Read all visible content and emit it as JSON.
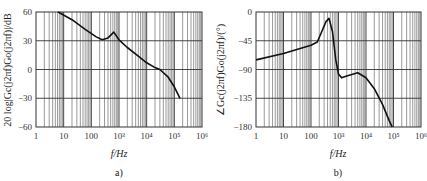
{
  "chart_data": [
    {
      "id": "a",
      "type": "line",
      "caption": "a)",
      "title": "",
      "xlabel": "f/Hz",
      "ylabel": "20 log|Gc(j2πf)Go(j2πf)|/dB",
      "xscale": "log",
      "xlim": [
        1,
        1000000
      ],
      "ylim": [
        -60,
        60
      ],
      "x_tick_labels": [
        "1",
        "10",
        "100",
        "10³",
        "10⁴",
        "10⁵",
        "10⁶"
      ],
      "y_ticks": [
        60,
        30,
        0,
        -30,
        -60
      ],
      "grid": true,
      "legend": null,
      "series": [
        {
          "name": "magnitude",
          "x": [
            6.3,
            20,
            60,
            150,
            250,
            400,
            650,
            1000,
            2000,
            5000,
            10000,
            20000,
            30000,
            60000,
            100000,
            160000
          ],
          "y": [
            60,
            52,
            42,
            34,
            31,
            33,
            39,
            31,
            23,
            14,
            7,
            2,
            0,
            -8,
            -18,
            -30
          ]
        }
      ]
    },
    {
      "id": "b",
      "type": "line",
      "caption": "b)",
      "title": "",
      "xlabel": "f/Hz",
      "ylabel": "∠Gc(j2πf)Go(j2πf)/(°)",
      "xscale": "log",
      "xlim": [
        1,
        1000000
      ],
      "ylim": [
        -180,
        0
      ],
      "x_tick_labels": [
        "1",
        "10",
        "100",
        "10³",
        "10⁴",
        "10⁵",
        "10⁶"
      ],
      "y_ticks": [
        0,
        -45,
        -90,
        -135,
        -180
      ],
      "grid": true,
      "legend": null,
      "series": [
        {
          "name": "phase",
          "x": [
            1,
            10,
            100,
            170,
            250,
            350,
            450,
            600,
            800,
            1000,
            1300,
            2000,
            5000,
            10000,
            20000,
            40000,
            70000,
            90000
          ],
          "y": [
            -75,
            -65,
            -52,
            -47,
            -30,
            -15,
            -10,
            -30,
            -75,
            -97,
            -103,
            -100,
            -95,
            -103,
            -120,
            -145,
            -170,
            -180
          ]
        }
      ]
    }
  ],
  "labels": {
    "a": {
      "ylabel": "20 log|Gc(j2πf)Go(j2πf)|/dB",
      "xlabel": "f/Hz",
      "caption": "a)",
      "y_ticks": [
        "60",
        "30",
        "0",
        "−30",
        "−60"
      ]
    },
    "b": {
      "ylabel": "∠Gc(j2πf)Go(j2πf)/(°)",
      "xlabel": "f/Hz",
      "caption": "b)",
      "y_ticks": [
        "0",
        "−45",
        "−90",
        "−135",
        "−180"
      ]
    },
    "x_ticks": [
      "1",
      "10",
      "100",
      "10³",
      "10⁴",
      "10⁵",
      "10⁶"
    ]
  }
}
